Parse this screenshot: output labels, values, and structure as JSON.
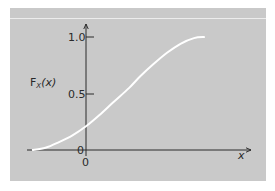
{
  "chart_data": {
    "type": "line",
    "title": "",
    "xlabel": "x",
    "ylabel": "F_X(x)",
    "ylabel_main": "F",
    "ylabel_sub": "X",
    "ylabel_arg": "(x)",
    "y_ticks": [
      "0",
      "0.5",
      "1.0"
    ],
    "x_ticks": [
      "0"
    ],
    "ylim": [
      0,
      1.0
    ],
    "grid": false,
    "legend": null,
    "series": [
      {
        "name": "F_X(x) cumulative distribution function",
        "color": "#ffffff",
        "x": [
          -1.0,
          -0.75,
          -0.5,
          -0.25,
          0.0,
          0.25,
          0.5,
          0.8,
          1.0,
          1.25,
          1.5,
          1.75,
          2.0,
          2.2
        ],
        "y": [
          0.0,
          0.02,
          0.07,
          0.13,
          0.21,
          0.31,
          0.42,
          0.55,
          0.65,
          0.76,
          0.86,
          0.94,
          0.99,
          1.0
        ]
      }
    ]
  },
  "colors": {
    "panel": "#c9c9c9",
    "axis": "#2a2a2a",
    "curve": "#ffffff"
  }
}
